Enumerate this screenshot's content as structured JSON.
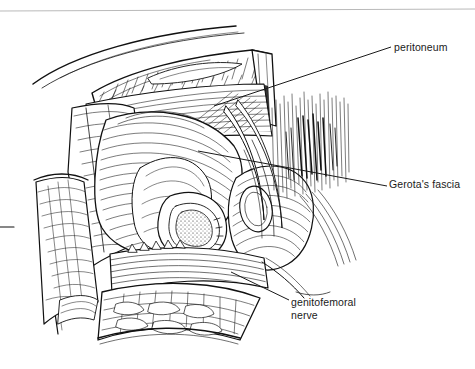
{
  "figure": {
    "kind": "surgical-anatomy-line-drawing",
    "background_color": "#ffffff",
    "ink_color": "#111111",
    "top_rule_color": "#b9b9b9"
  },
  "labels": [
    {
      "id": "peritoneum",
      "text": "peritoneum",
      "leader": {
        "x1": 214,
        "y1": 106,
        "x2": 391,
        "y2": 47
      }
    },
    {
      "id": "gerotas_fascia",
      "text": "Gerota's fascia",
      "leader": {
        "x1": 198,
        "y1": 151,
        "x2": 387,
        "y2": 186
      }
    },
    {
      "id": "genitofemoral_nerve",
      "text": "genitofemoral\nnerve",
      "line1": "genitofemoral",
      "line2": "nerve",
      "leader": {
        "x1": 231,
        "y1": 272,
        "x2": 289,
        "y2": 300
      }
    }
  ]
}
